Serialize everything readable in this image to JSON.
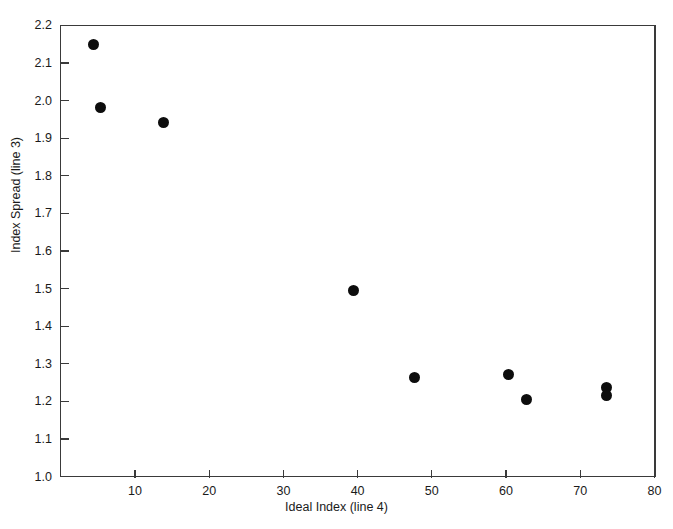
{
  "chart_data": {
    "type": "scatter",
    "title": "",
    "subtitle": "",
    "xlabel": "Ideal Index (line 4)",
    "ylabel": "Index Spread (line 3)",
    "xlim": [
      0,
      80
    ],
    "ylim": [
      1.0,
      2.2
    ],
    "xticks": [
      10,
      20,
      30,
      40,
      50,
      60,
      70,
      80
    ],
    "xticklabels": [
      "10",
      "20",
      "30",
      "40",
      "50",
      "60",
      "70",
      "80"
    ],
    "yticks": [
      1.0,
      1.1,
      1.2,
      1.3,
      1.4,
      1.5,
      1.6,
      1.7,
      1.8,
      1.9,
      2.0,
      2.1,
      2.2
    ],
    "yticklabels": [
      "1.0",
      "1.1",
      "1.2",
      "1.3",
      "1.4",
      "1.5",
      "1.6",
      "1.7",
      "1.8",
      "1.9",
      "2.0",
      "2.1",
      "2.2"
    ],
    "grid": false,
    "legend": null,
    "marker": "filled-circle",
    "marker_color": "#0d0d0d",
    "axis_color": "#3a3a3a",
    "background": "#ffffff",
    "series": [
      {
        "name": "observations",
        "points": [
          {
            "x": 4.4,
            "y": 2.148
          },
          {
            "x": 5.3,
            "y": 1.982
          },
          {
            "x": 13.8,
            "y": 1.941
          },
          {
            "x": 39.5,
            "y": 1.494
          },
          {
            "x": 47.7,
            "y": 1.263
          },
          {
            "x": 60.4,
            "y": 1.271
          },
          {
            "x": 62.8,
            "y": 1.204
          },
          {
            "x": 73.6,
            "y": 1.238
          },
          {
            "x": 73.6,
            "y": 1.215
          }
        ]
      }
    ]
  }
}
